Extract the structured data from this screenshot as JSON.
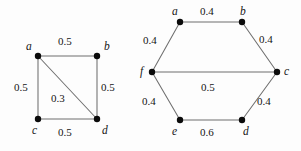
{
  "figure": {
    "background_color": "#fdfdfd",
    "edge_color": "#6f6f6f",
    "vertex_color": "#0b0b0b",
    "text_color": "#151515"
  },
  "graphs": [
    {
      "id": "square-graph",
      "name": "weighted-square-graph",
      "shape": "square-with-diagonal",
      "vertices": [
        {
          "id": "a",
          "label": "a",
          "x": 38,
          "y": 56,
          "label_x": 26,
          "label_y": 41
        },
        {
          "id": "b",
          "label": "b",
          "x": 97,
          "y": 56,
          "label_x": 104,
          "label_y": 41
        },
        {
          "id": "c",
          "label": "c",
          "x": 38,
          "y": 119,
          "label_x": 32,
          "label_y": 125
        },
        {
          "id": "d",
          "label": "d",
          "x": 97,
          "y": 119,
          "label_x": 102,
          "label_y": 125
        }
      ],
      "edges": [
        {
          "from": "a",
          "to": "b",
          "weight": "0.5",
          "label_x": 58,
          "label_y": 36
        },
        {
          "from": "a",
          "to": "c",
          "weight": "0.5",
          "label_x": 14,
          "label_y": 82
        },
        {
          "from": "b",
          "to": "d",
          "weight": "0.5",
          "label_x": 101,
          "label_y": 82
        },
        {
          "from": "c",
          "to": "d",
          "weight": "0.5",
          "label_x": 58,
          "label_y": 127
        },
        {
          "from": "a",
          "to": "d",
          "weight": "0.3",
          "label_x": 51,
          "label_y": 93
        }
      ]
    },
    {
      "id": "hexagon-graph",
      "name": "weighted-hexagon-graph",
      "shape": "hexagon-with-horizontal-chord",
      "vertices": [
        {
          "id": "a",
          "label": "a",
          "x": 180,
          "y": 22,
          "label_x": 172,
          "label_y": 6
        },
        {
          "id": "b",
          "label": "b",
          "x": 242,
          "y": 22,
          "label_x": 240,
          "label_y": 6
        },
        {
          "id": "c",
          "label": "c",
          "x": 277,
          "y": 72,
          "label_x": 284,
          "label_y": 66
        },
        {
          "id": "d",
          "label": "d",
          "x": 242,
          "y": 120,
          "label_x": 243,
          "label_y": 126
        },
        {
          "id": "e",
          "label": "e",
          "x": 180,
          "y": 120,
          "label_x": 172,
          "label_y": 126
        },
        {
          "id": "f",
          "label": "f",
          "x": 152,
          "y": 72,
          "label_x": 140,
          "label_y": 66
        }
      ],
      "edges": [
        {
          "from": "a",
          "to": "b",
          "weight": "0.4",
          "label_x": 200,
          "label_y": 6
        },
        {
          "from": "b",
          "to": "c",
          "weight": "0.4",
          "label_x": 259,
          "label_y": 34
        },
        {
          "from": "c",
          "to": "d",
          "weight": "0.4",
          "label_x": 257,
          "label_y": 96
        },
        {
          "from": "d",
          "to": "e",
          "weight": "0.6",
          "label_x": 200,
          "label_y": 127
        },
        {
          "from": "e",
          "to": "f",
          "weight": "0.4",
          "label_x": 142,
          "label_y": 96
        },
        {
          "from": "f",
          "to": "a",
          "weight": "0.4",
          "label_x": 143,
          "label_y": 35
        },
        {
          "from": "f",
          "to": "c",
          "weight": "0.5",
          "label_x": 201,
          "label_y": 82
        }
      ]
    }
  ]
}
